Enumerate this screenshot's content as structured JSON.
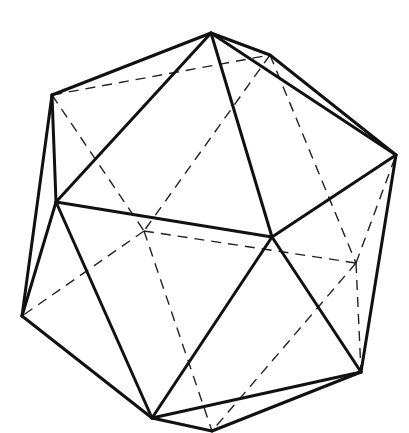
{
  "figure": {
    "style": "line drawing, visible edges solid, hidden edges dashed",
    "colors": {
      "background": "#ffffff",
      "line": "#111111"
    },
    "vertices": {
      "A": [
        211,
        33
      ],
      "B": [
        52,
        95
      ],
      "C": [
        270,
        55
      ],
      "D": [
        396,
        155
      ],
      "E": [
        56,
        202
      ],
      "F": [
        272,
        237
      ],
      "G": [
        22,
        316
      ],
      "H": [
        361,
        372
      ],
      "I": [
        152,
        418
      ],
      "J": [
        144,
        231
      ],
      "K": [
        356,
        263
      ],
      "L": [
        212,
        431
      ]
    },
    "visible_edges": [
      [
        "A",
        "B"
      ],
      [
        "A",
        "C"
      ],
      [
        "A",
        "E"
      ],
      [
        "A",
        "F"
      ],
      [
        "A",
        "D"
      ],
      [
        "C",
        "D"
      ],
      [
        "B",
        "E"
      ],
      [
        "B",
        "G"
      ],
      [
        "E",
        "G"
      ],
      [
        "E",
        "F"
      ],
      [
        "E",
        "I"
      ],
      [
        "D",
        "F"
      ],
      [
        "D",
        "H"
      ],
      [
        "F",
        "H"
      ],
      [
        "F",
        "I"
      ],
      [
        "G",
        "I"
      ],
      [
        "I",
        "H"
      ],
      [
        "I",
        "L"
      ],
      [
        "L",
        "H"
      ]
    ],
    "hidden_edges": [
      [
        "B",
        "C"
      ],
      [
        "B",
        "J"
      ],
      [
        "C",
        "J"
      ],
      [
        "C",
        "K"
      ],
      [
        "J",
        "G"
      ],
      [
        "J",
        "K"
      ],
      [
        "J",
        "L"
      ],
      [
        "K",
        "D"
      ],
      [
        "K",
        "H"
      ],
      [
        "K",
        "L"
      ]
    ]
  }
}
